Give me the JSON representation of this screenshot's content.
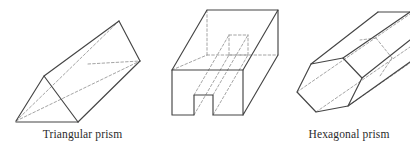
{
  "page": {
    "background_color": "#ffffff",
    "width": 410,
    "height": 150
  },
  "style": {
    "visible_edge_color": "#454545",
    "hidden_edge_color": "#9a9a9a",
    "face_color": "#ffffff",
    "caption_color": "#2b2b2b"
  },
  "figures": [
    {
      "id": "triangular-prism",
      "caption": "Triangular prism",
      "description": "Oblique triangular prism tilted up to the right, resting on a horizontal base line, with hidden edges shown dashed."
    },
    {
      "id": "channel-prism",
      "caption": "",
      "description": "Rectangular block with a U-shaped notch cut through its length, drawn in oblique projection with dashed hidden edges."
    },
    {
      "id": "hexagonal-prism",
      "caption": "Hexagonal prism",
      "description": "Long hexagonal prism receding to the upper right and clipped by the right edge of the image, with dashed hidden edges."
    }
  ],
  "captions": {
    "triangular": "Triangular prism",
    "hexagonal": "Hexagonal prism"
  }
}
